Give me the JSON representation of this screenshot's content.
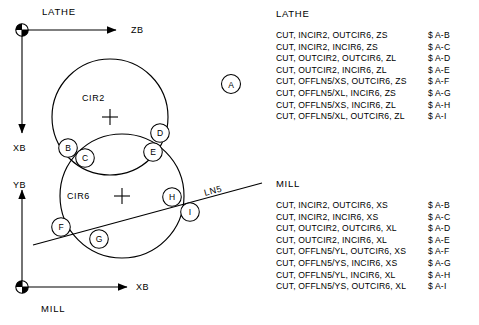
{
  "diagram": {
    "lathe_system": {
      "name": "LATHE",
      "horizontal_axis": "ZB",
      "vertical_axis": "XB",
      "origin_symbol": "datum-target-icon"
    },
    "mill_system": {
      "name": "MILL",
      "horizontal_axis": "XB",
      "vertical_axis": "YB",
      "origin_symbol": "datum-target-icon"
    },
    "geometry": {
      "circle_upper": "CIR2",
      "circle_lower": "CIR6",
      "line": "LN5",
      "callout": "A"
    },
    "points": [
      {
        "label": "B",
        "cx": 68,
        "cy": 148
      },
      {
        "label": "C",
        "cx": 85,
        "cy": 158
      },
      {
        "label": "D",
        "cx": 160,
        "cy": 133
      },
      {
        "label": "E",
        "cx": 153,
        "cy": 152
      },
      {
        "label": "F",
        "cx": 61,
        "cy": 227
      },
      {
        "label": "G",
        "cx": 99,
        "cy": 239
      },
      {
        "label": "H",
        "cx": 172,
        "cy": 197
      },
      {
        "label": "I",
        "cx": 190,
        "cy": 212
      }
    ]
  },
  "lathe_code": {
    "title": "LATHE",
    "lines": [
      {
        "stmt": "CUT, INCIR2, OUTCIR6, ZS",
        "ref": "$ A-B"
      },
      {
        "stmt": "CUT, INCIR2, INCIR6, ZS",
        "ref": "$ A-C"
      },
      {
        "stmt": "CUT, OUTCIR2, OUTCIR6, ZL",
        "ref": "$ A-D"
      },
      {
        "stmt": "CUT, OUTCIR2, INCIR6, ZL",
        "ref": "$ A-E"
      },
      {
        "stmt": "CUT, OFFLN5/XS, OUTCIR6, ZS",
        "ref": "$ A-F"
      },
      {
        "stmt": "CUT, OFFLN5/XL, INCIR6, ZS",
        "ref": "$ A-G"
      },
      {
        "stmt": "CUT, OFFLN5/XS, INCIR6, ZL",
        "ref": "$ A-H"
      },
      {
        "stmt": "CUT, OFFLN5/XL, OUTCIR6, ZL",
        "ref": "$ A-I"
      }
    ]
  },
  "mill_code": {
    "title": "MILL",
    "lines": [
      {
        "stmt": "CUT, INCIR2, OUTCIR6, XS",
        "ref": "$ A-B"
      },
      {
        "stmt": "CUT, INCIR2, INCIR6, XS",
        "ref": "$ A-C"
      },
      {
        "stmt": "CUT, OUTCIR2, OUTCIR6, XL",
        "ref": "$ A-D"
      },
      {
        "stmt": "CUT, OUTCIR2, INCIR6, XL",
        "ref": "$ A-E"
      },
      {
        "stmt": "CUT, OFFLN5/YL, OUTCIR6, XS",
        "ref": "$ A-F"
      },
      {
        "stmt": "CUT, OFFLN5/YS, INCIR6, XS",
        "ref": "$ A-G"
      },
      {
        "stmt": "CUT, OFFLN5/YL, INCIR6, XL",
        "ref": "$ A-H"
      },
      {
        "stmt": "CUT, OFFLN5/YS, OUTCIR6, XL",
        "ref": "$ A-I"
      }
    ]
  },
  "colors": {
    "ink": "#000000",
    "paper": "#ffffff"
  }
}
